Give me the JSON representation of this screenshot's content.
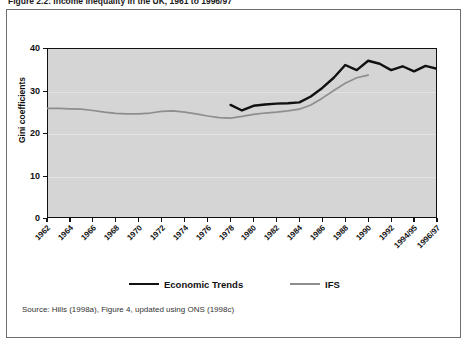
{
  "figure": {
    "caption": "Figure 2.2: Income inequality in the UK, 1961 to 1996/97",
    "source_note": "Source: Hills (1998a), Figure 4, updated using ONS (1998c)"
  },
  "legend": {
    "position": "bottom",
    "items": [
      {
        "label": "Economic Trends",
        "color": "#111111",
        "width": 2.6
      },
      {
        "label": "IFS",
        "color": "#8e8e8e",
        "width": 1.6
      }
    ]
  },
  "colors": {
    "plot_background": "#d5d5d5",
    "frame": "#111111",
    "gridline": "#e2e2e2",
    "economic_trends": "#111111",
    "ifs": "#8e8e8e",
    "page_background": "#ffffff",
    "outer_border": "#6e6e6e"
  },
  "chart_data": {
    "type": "line",
    "title": "Figure 2.2: Income inequality in the UK, 1961 to 1996/97",
    "xlabel": "",
    "ylabel": "Gini coefficients",
    "ylim": [
      0,
      40
    ],
    "yticks": [
      0,
      10,
      20,
      30,
      40
    ],
    "grid": true,
    "legend_position": "bottom",
    "categories": [
      "1962",
      "1963",
      "1964",
      "1965",
      "1966",
      "1967",
      "1968",
      "1969",
      "1970",
      "1971",
      "1972",
      "1973",
      "1974",
      "1975",
      "1976",
      "1977",
      "1978",
      "1979",
      "1980",
      "1981",
      "1982",
      "1983",
      "1984",
      "1985",
      "1986",
      "1987",
      "1988",
      "1989",
      "1990",
      "1991",
      "1992",
      "1993",
      "1994/95",
      "1995/96",
      "1996/97"
    ],
    "tick_labels": [
      "1962",
      "1964",
      "1966",
      "1968",
      "1970",
      "1972",
      "1974",
      "1976",
      "1978",
      "1980",
      "1982",
      "1984",
      "1986",
      "1988",
      "1990",
      "1992",
      "1994/95",
      "1996/97"
    ],
    "series": [
      {
        "name": "IFS",
        "color": "#8e8e8e",
        "x": [
          "1962",
          "1963",
          "1964",
          "1965",
          "1966",
          "1967",
          "1968",
          "1969",
          "1970",
          "1971",
          "1972",
          "1973",
          "1974",
          "1975",
          "1976",
          "1977",
          "1978",
          "1979",
          "1980",
          "1981",
          "1982",
          "1983",
          "1984",
          "1985",
          "1986",
          "1987",
          "1988",
          "1989",
          "1990"
        ],
        "values": [
          25.8,
          25.8,
          25.7,
          25.6,
          25.3,
          24.9,
          24.6,
          24.5,
          24.5,
          24.7,
          25.1,
          25.2,
          24.9,
          24.5,
          24.0,
          23.6,
          23.5,
          23.9,
          24.4,
          24.7,
          24.9,
          25.2,
          25.6,
          26.6,
          28.2,
          30.0,
          31.7,
          33.0,
          33.6
        ]
      },
      {
        "name": "Economic Trends",
        "color": "#111111",
        "x": [
          "1978",
          "1979",
          "1980",
          "1981",
          "1982",
          "1983",
          "1984",
          "1985",
          "1986",
          "1987",
          "1988",
          "1989",
          "1990",
          "1991",
          "1992",
          "1993",
          "1994/95",
          "1995/96",
          "1996/97"
        ],
        "values": [
          26.6,
          25.3,
          26.4,
          26.7,
          26.9,
          27.0,
          27.2,
          28.6,
          30.6,
          33.0,
          36.0,
          34.8,
          37.0,
          36.3,
          34.8,
          35.7,
          34.5,
          35.8,
          35.1
        ]
      }
    ]
  },
  "axes": {
    "y_min": 0,
    "y_max": 40,
    "y_step": 10
  }
}
